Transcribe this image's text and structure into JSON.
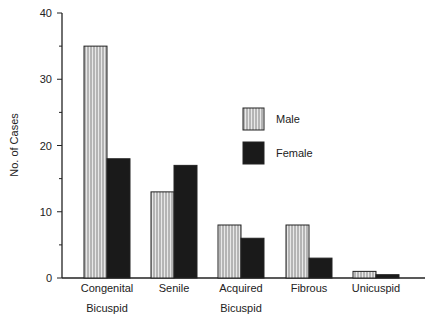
{
  "chart_data": {
    "type": "bar",
    "title": "",
    "xlabel": "",
    "ylabel": "No. of Cases",
    "ylim": [
      0,
      40
    ],
    "yticks": [
      0,
      10,
      20,
      30,
      40
    ],
    "categories": [
      {
        "line1": "Congenital",
        "line2": "Bicuspid"
      },
      {
        "line1": "Senile",
        "line2": ""
      },
      {
        "line1": "Acquired",
        "line2": "Bicuspid"
      },
      {
        "line1": "Fibrous",
        "line2": ""
      },
      {
        "line1": "Unicuspid",
        "line2": ""
      }
    ],
    "series": [
      {
        "name": "Male",
        "pattern": "vertical-hatch",
        "values": [
          35,
          13,
          8,
          8,
          1
        ]
      },
      {
        "name": "Female",
        "pattern": "solid-black",
        "values": [
          18,
          17,
          6,
          3,
          0.5
        ]
      }
    ],
    "legend_position": "upper-right-inside",
    "grid": false
  }
}
